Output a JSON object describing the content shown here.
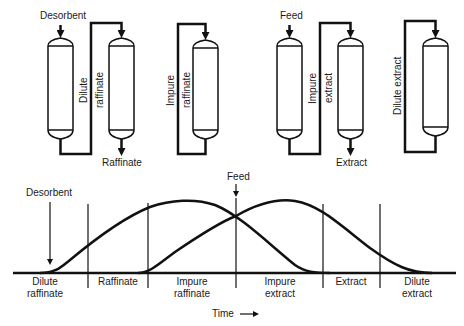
{
  "colors": {
    "ink": "#111111",
    "background": "#ffffff",
    "label": "#1a1a1a"
  },
  "top": {
    "inputs": {
      "desorbent": "Desorbent",
      "feed": "Feed"
    },
    "outputs": {
      "raffinate": "Raffinate",
      "extract": "Extract"
    },
    "streams": {
      "dilute_raffinate_1": "Dilute",
      "dilute_raffinate_2": "raffinate",
      "impure_raffinate_1": "Impure",
      "impure_raffinate_2": "raffinate",
      "impure_extract_1": "Impure",
      "impure_extract_2": "extract",
      "dilute_extract": "Dilute extract"
    }
  },
  "chart": {
    "desorbent": "Desorbent",
    "feed": "Feed",
    "time_label": "Time",
    "segments": [
      {
        "line1": "Dilute",
        "line2": "raffinate"
      },
      {
        "line1": "Raffinate",
        "line2": ""
      },
      {
        "line1": "Impure",
        "line2": "raffinate"
      },
      {
        "line1": "Impure",
        "line2": "extract"
      },
      {
        "line1": "Extract",
        "line2": ""
      },
      {
        "line1": "Dilute",
        "line2": "extract"
      }
    ]
  }
}
